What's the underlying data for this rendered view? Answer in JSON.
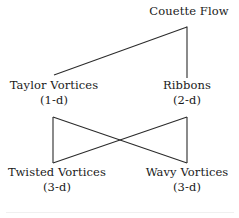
{
  "diagram": {
    "type": "bifurcation-diagram",
    "title": "Couette Flow",
    "background_color": "#ffffff",
    "line_color": "#2b2b2b",
    "text_color": "#1a1a1a",
    "nodes": [
      {
        "id": "couette-flow",
        "name": "Couette Flow",
        "dimension": "",
        "x": 189,
        "y": 14
      },
      {
        "id": "taylor-vortices",
        "name": "Taylor Vortices",
        "dimension": "(1-d)",
        "x": 54,
        "y": 88
      },
      {
        "id": "ribbons",
        "name": "Ribbons",
        "dimension": "(2-d)",
        "x": 187,
        "y": 88
      },
      {
        "id": "twisted-vortices",
        "name": "Twisted Vortices",
        "dimension": "(3-d)",
        "x": 57,
        "y": 175
      },
      {
        "id": "wavy-vortices",
        "name": "Wavy Vortices",
        "dimension": "(3-d)",
        "x": 187,
        "y": 175
      }
    ],
    "edges": [
      {
        "id": "couette-to-taylor",
        "from": "couette-flow",
        "to": "taylor-vortices",
        "x1": 187,
        "y1": 27,
        "x2": 54,
        "y2": 75
      },
      {
        "id": "couette-to-ribbons",
        "from": "couette-flow",
        "to": "ribbons",
        "x1": 187,
        "y1": 27,
        "x2": 187,
        "y2": 78
      },
      {
        "id": "taylor-to-twisted",
        "from": "taylor-vortices",
        "to": "twisted-vortices",
        "x1": 53,
        "y1": 117,
        "x2": 53,
        "y2": 163
      },
      {
        "id": "taylor-to-wavy",
        "from": "taylor-vortices",
        "to": "wavy-vortices",
        "x1": 53,
        "y1": 117,
        "x2": 187,
        "y2": 163
      },
      {
        "id": "ribbons-to-twisted",
        "from": "ribbons",
        "to": "twisted-vortices",
        "x1": 187,
        "y1": 117,
        "x2": 53,
        "y2": 163
      },
      {
        "id": "ribbons-to-wavy",
        "from": "ribbons",
        "to": "wavy-vortices",
        "x1": 187,
        "y1": 117,
        "x2": 187,
        "y2": 163
      }
    ]
  }
}
